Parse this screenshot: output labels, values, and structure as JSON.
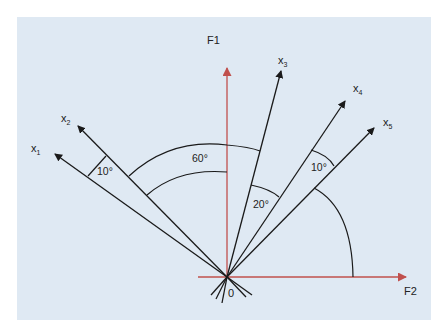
{
  "diagram": {
    "type": "factor-loading vector diagram",
    "axes": {
      "vertical": {
        "label": "F1",
        "color": "#c0504d"
      },
      "horizontal": {
        "label": "F2",
        "color": "#c0504d"
      },
      "origin_label": "0"
    },
    "vectors": [
      {
        "name": "x",
        "sub": "1"
      },
      {
        "name": "x",
        "sub": "2"
      },
      {
        "name": "x",
        "sub": "3"
      },
      {
        "name": "x",
        "sub": "4"
      },
      {
        "name": "x",
        "sub": "5"
      }
    ],
    "angles": {
      "x1_x2": "10°",
      "x2_x3": "60°",
      "x2_F1": "45°12'",
      "x3_x4": "20°",
      "x4_x5": "10°",
      "x5_F2": "45°12'"
    },
    "colors": {
      "background": "#dfe9f3",
      "vector": "#1a1a1a",
      "axis": "#c0504d"
    }
  }
}
